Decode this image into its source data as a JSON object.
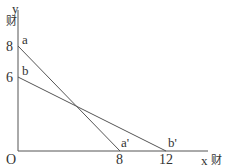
{
  "diagram": {
    "title": "",
    "axes": {
      "y_label": "y",
      "y_unit": "财",
      "x_label": "x",
      "x_unit": "财",
      "origin": "O"
    },
    "y_ticks": [
      "8",
      "6"
    ],
    "x_ticks": [
      "8",
      "12"
    ],
    "lines": [
      {
        "name": "aa'",
        "start_label": "a",
        "end_label": "a'",
        "from": [
          0,
          8
        ],
        "to": [
          8,
          0
        ]
      },
      {
        "name": "bb'",
        "start_label": "b",
        "end_label": "b'",
        "from": [
          0,
          6
        ],
        "to": [
          12,
          0
        ]
      }
    ],
    "colors": {
      "line": "#555555",
      "axis": "#555555",
      "text": "#333333"
    }
  }
}
